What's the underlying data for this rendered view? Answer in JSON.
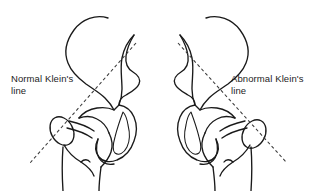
{
  "figure": {
    "background_color": "#ffffff",
    "ink_color": "#1a1a1a",
    "dash_color": "#3a3a3a",
    "width": 314,
    "height": 191
  },
  "labels": {
    "normal": {
      "text": "Normal Klein's\nline",
      "line1": "Normal Klein's",
      "line2": "line"
    },
    "abnormal": {
      "text": "Abnormal Klein's\nline",
      "line1": "Abnormal Klein's",
      "line2": "line"
    }
  },
  "panels": [
    {
      "id": "left-hip",
      "side": "left",
      "label": "Normal Klein's line",
      "finding": "normal",
      "klein_line": {
        "x1": 136,
        "y1": 43,
        "x2": 30,
        "y2": 163
      }
    },
    {
      "id": "right-hip",
      "side": "right",
      "label": "Abnormal Klein's line",
      "finding": "abnormal",
      "klein_line": {
        "x1": 181,
        "y1": 43,
        "x2": 287,
        "y2": 163
      }
    }
  ],
  "anatomy": [
    "iliac-wing",
    "acetabulum",
    "obturator-foramen",
    "femoral-head",
    "femoral-neck",
    "greater-trochanter",
    "lesser-trochanter",
    "femoral-shaft"
  ]
}
